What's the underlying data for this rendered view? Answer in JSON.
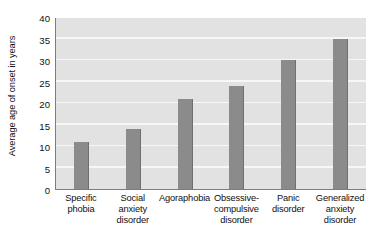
{
  "chart_data": {
    "type": "bar",
    "title": "",
    "xlabel": "",
    "ylabel": "Average age of onset in years",
    "ylim": [
      0,
      40
    ],
    "ytick_values": [
      40,
      35,
      30,
      25,
      20,
      15,
      10,
      5,
      0
    ],
    "ytick_labels": [
      "40",
      "35",
      "30",
      "25",
      "20",
      "15",
      "10",
      "5",
      "0"
    ],
    "grid": true,
    "legend": "none",
    "categories": [
      "Specific phobia",
      "Social anxiety disorder",
      "Agoraphobia",
      "Obsessive-compulsive disorder",
      "Panic disorder",
      "Generalized anxiety disorder"
    ],
    "category_label_lines": [
      [
        "Specific",
        "phobia"
      ],
      [
        "Social",
        "anxiety",
        "disorder"
      ],
      [
        "Agoraphobia"
      ],
      [
        "Obsessive-",
        "compulsive",
        "disorder"
      ],
      [
        "Panic",
        "disorder"
      ],
      [
        "Generalized",
        "anxiety",
        "disorder"
      ]
    ],
    "values": [
      11,
      14,
      21,
      24,
      30,
      35
    ],
    "bar_color": "#8b8b8b",
    "plot_background": "#e2e2e2",
    "gridline_color": "#f7f7f7",
    "axis_color": "#7d7d7d"
  }
}
